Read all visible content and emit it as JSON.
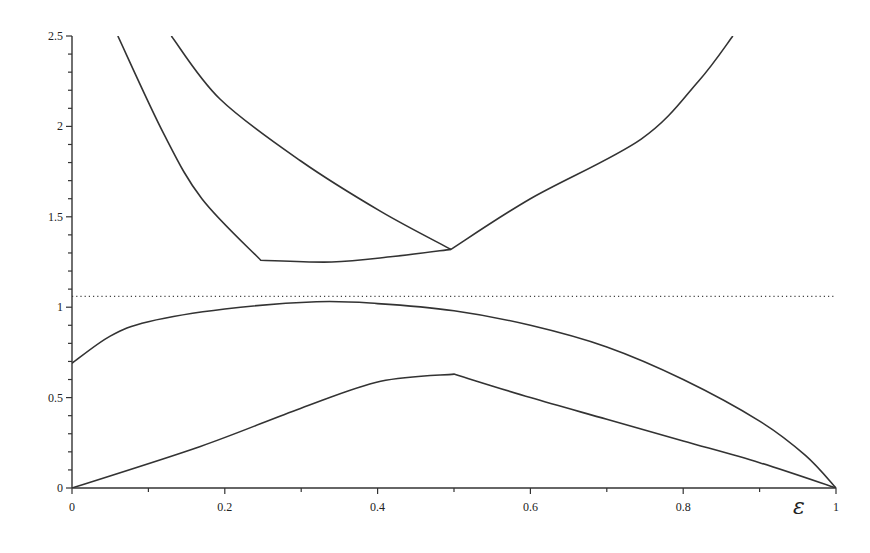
{
  "chart_data": {
    "type": "line",
    "title": "",
    "xlabel": "ε",
    "ylabel": "",
    "xlim": [
      0,
      1
    ],
    "ylim": [
      0,
      2.5
    ],
    "grid": false,
    "legend": null,
    "x_ticks": [
      "0",
      "0.2",
      "0.4",
      "0.6",
      "0.8",
      "1"
    ],
    "y_ticks": [
      "0",
      "0.5",
      "1",
      "1.5",
      "2",
      "2.5"
    ],
    "series": [
      {
        "name": "upper-left branch",
        "points": [
          [
            0.06,
            2.5
          ],
          [
            0.12,
            1.96
          ],
          [
            0.17,
            1.6
          ],
          [
            0.247,
            1.26
          ],
          [
            0.34,
            1.25
          ],
          [
            0.42,
            1.28
          ],
          [
            0.496,
            1.32
          ]
        ]
      },
      {
        "name": "upper-right branch",
        "points": [
          [
            0.13,
            2.5
          ],
          [
            0.194,
            2.15
          ],
          [
            0.299,
            1.81
          ],
          [
            0.404,
            1.53
          ],
          [
            0.496,
            1.32
          ],
          [
            0.6,
            1.6
          ],
          [
            0.745,
            1.93
          ],
          [
            0.82,
            2.25
          ],
          [
            0.865,
            2.5
          ]
        ]
      },
      {
        "name": "lower arc",
        "points": [
          [
            0,
            0.69
          ],
          [
            0.05,
            0.84
          ],
          [
            0.1,
            0.92
          ],
          [
            0.2,
            0.99
          ],
          [
            0.32,
            1.03
          ],
          [
            0.4,
            1.02
          ],
          [
            0.5,
            0.98
          ],
          [
            0.6,
            0.9
          ],
          [
            0.7,
            0.78
          ],
          [
            0.8,
            0.6
          ],
          [
            0.9,
            0.37
          ],
          [
            0.96,
            0.18
          ],
          [
            1,
            0
          ]
        ]
      },
      {
        "name": "lower triangle",
        "points": [
          [
            0,
            0
          ],
          [
            0.168,
            0.23
          ],
          [
            0.299,
            0.44
          ],
          [
            0.404,
            0.59
          ],
          [
            0.5,
            0.63
          ],
          [
            0.6,
            0.5
          ],
          [
            0.7,
            0.38
          ],
          [
            0.8,
            0.26
          ],
          [
            0.9,
            0.14
          ],
          [
            1,
            0
          ]
        ]
      },
      {
        "name": "dotted reference",
        "style": "dotted",
        "points": [
          [
            0,
            1.06
          ],
          [
            1,
            1.06
          ]
        ]
      }
    ]
  }
}
